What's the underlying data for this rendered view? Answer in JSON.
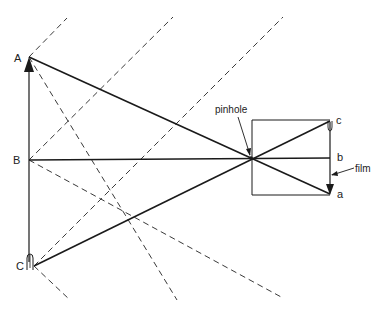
{
  "diagram": {
    "colors": {
      "line": "#1a1a1a",
      "dashed": "#3a3a3a",
      "text": "#222222",
      "background": "#ffffff"
    },
    "labels": {
      "A": "A",
      "B": "B",
      "C": "C",
      "a": "a",
      "b": "b",
      "c": "c",
      "pinhole": "pinhole",
      "film": "film"
    },
    "object": {
      "points": {
        "A": [
          29,
          57
        ],
        "B": [
          29,
          160
        ],
        "C": [
          34,
          266
        ]
      },
      "arrow_direction": "up"
    },
    "camera": {
      "box": {
        "x": 252,
        "y": 120,
        "width": 78,
        "height": 75
      },
      "pinhole": [
        251,
        158
      ],
      "film_x": 330,
      "image_points": {
        "c": [
          330,
          121
        ],
        "b": [
          330,
          158
        ],
        "a": [
          330,
          194
        ]
      },
      "image_arrow_direction": "down"
    },
    "rays": [
      {
        "from": "A",
        "to": "a"
      },
      {
        "from": "B",
        "to": "b"
      },
      {
        "from": "C",
        "to": "c"
      }
    ],
    "dashed_lines": [
      {
        "from": [
          29,
          57
        ],
        "to": [
          67,
          18
        ]
      },
      {
        "from": [
          29,
          160
        ],
        "to": [
          173,
          17
        ]
      },
      {
        "from": [
          34,
          266
        ],
        "to": [
          283,
          17
        ]
      },
      {
        "from": [
          29,
          57
        ],
        "to": [
          177,
          300
        ]
      },
      {
        "from": [
          29,
          160
        ],
        "to": [
          283,
          298
        ]
      },
      {
        "from": [
          34,
          266
        ],
        "to": [
          70,
          300
        ]
      }
    ]
  }
}
